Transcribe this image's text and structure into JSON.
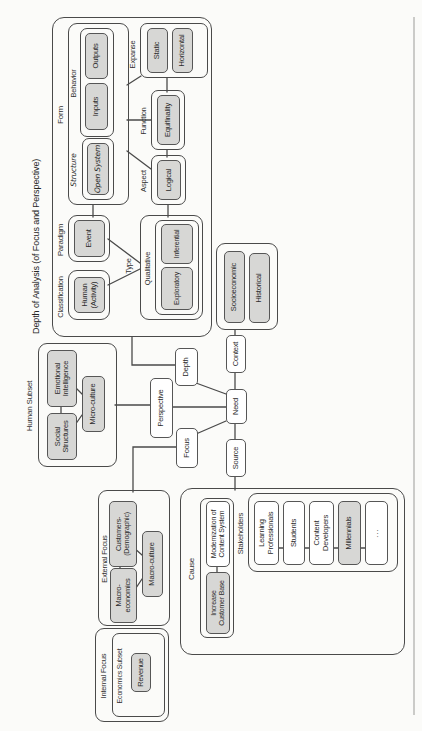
{
  "figure": {
    "title": "Depth of Analysis (of Focus and Perspective)"
  },
  "groups": {
    "classification": "Classification",
    "paradigm": "Paradigm",
    "form": "Form",
    "structure": "Structure",
    "behavior": "Behavior",
    "expanse": "Expanse",
    "function": "Function",
    "aspect": "Aspect",
    "type": "Type",
    "qualitative": "Qualitative",
    "human_subset": "Human Subset",
    "internal_focus": "Internal Focus",
    "economics_subset": "Economics Subset",
    "external_focus": "External Focus",
    "cause": "Cause",
    "stakeholders": "Stakeholders"
  },
  "nodes": {
    "human_activity": "Human\n(Activity)",
    "event": "Event",
    "open_system": "Open System",
    "inputs": "Inputs",
    "outputs": "Outputs",
    "static": "Static",
    "horizontal": "Horizontal",
    "equifinality": "Equifinality",
    "logical": "Logical",
    "exploratory": "Exploratory",
    "inferential": "Inferential",
    "socioeconomic": "Socioeconomic",
    "historical": "Historical",
    "perspective": "Perspective",
    "depth": "Depth",
    "focus": "Focus",
    "need": "Need",
    "context": "Context",
    "source": "Source",
    "social_structures": "Social\nStructures",
    "emotional_intelligence": "Emotional\nIntelligence",
    "micro_culture": "Micro-culture",
    "macro_economics": "Macro-\neconomics",
    "customers_demographic": "Customers-\n(Demographic)",
    "macro_culture": "Macro-culture",
    "revenue": "Revenue",
    "increase_customer_base": "Increase\nCustomer Base",
    "modernization_of_content_system": "Modernization of\nContent System",
    "learning_professionals": "Learning\nProfessionals",
    "students": "Students",
    "content_developers": "Content\nDevelopers",
    "millennials": "Millennials",
    "more": "..."
  },
  "colors": {
    "shaded_fill": "#d7d7d5",
    "line": "#4a4a4a",
    "text": "#2a2a2a"
  }
}
